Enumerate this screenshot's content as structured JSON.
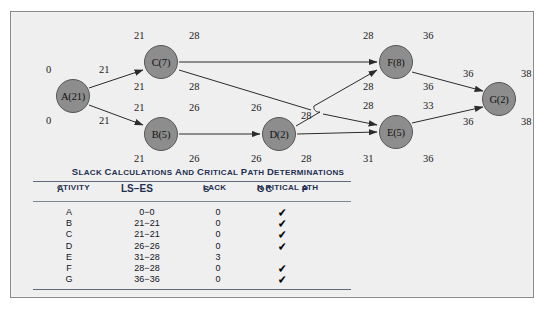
{
  "figure": {
    "background_color": "#efefef",
    "border_color": "#8a8a8a"
  },
  "diagram": {
    "type": "activity-on-node-network",
    "node_fill": "#8d8d8d",
    "node_stroke": "#575757",
    "nodes": [
      {
        "id": "A",
        "label": "A(21)",
        "duration": 21,
        "cx": 62,
        "cy": 84,
        "es": 0,
        "ef": 21,
        "ls": 0,
        "lf": 21
      },
      {
        "id": "C",
        "label": "C(7)",
        "duration": 7,
        "cx": 150,
        "cy": 50,
        "es": 21,
        "ef": 28,
        "ls": 21,
        "lf": 28
      },
      {
        "id": "B",
        "label": "B(5)",
        "duration": 5,
        "cx": 150,
        "cy": 122,
        "es": 21,
        "ef": 26,
        "ls": 21,
        "lf": 26
      },
      {
        "id": "D",
        "label": "D(2)",
        "duration": 2,
        "cx": 268,
        "cy": 122,
        "es": 26,
        "ef": 28,
        "ls": 26,
        "lf": 28
      },
      {
        "id": "F",
        "label": "F(8)",
        "duration": 8,
        "cx": 385,
        "cy": 50,
        "es": 28,
        "ef": 36,
        "ls": 28,
        "lf": 36
      },
      {
        "id": "E",
        "label": "E(5)",
        "duration": 5,
        "cx": 385,
        "cy": 120,
        "es": 28,
        "ef": 33,
        "ls": 31,
        "lf": 36
      },
      {
        "id": "G",
        "label": "G(2)",
        "duration": 2,
        "cx": 488,
        "cy": 87,
        "es": 36,
        "ef": 38,
        "ls": 36,
        "lf": 38
      }
    ],
    "edges": [
      {
        "from": "A",
        "to": "C"
      },
      {
        "from": "A",
        "to": "B"
      },
      {
        "from": "C",
        "to": "F"
      },
      {
        "from": "C",
        "to": "E"
      },
      {
        "from": "B",
        "to": "D"
      },
      {
        "from": "D",
        "to": "F"
      },
      {
        "from": "D",
        "to": "E"
      },
      {
        "from": "F",
        "to": "G"
      },
      {
        "from": "E",
        "to": "G"
      }
    ],
    "labels": [
      {
        "text": "0",
        "x": 35,
        "y": 52
      },
      {
        "text": "21",
        "x": 88,
        "y": 52
      },
      {
        "text": "0",
        "x": 35,
        "y": 103
      },
      {
        "text": "21",
        "x": 88,
        "y": 103
      },
      {
        "text": "21",
        "x": 123,
        "y": 18
      },
      {
        "text": "28",
        "x": 178,
        "y": 18
      },
      {
        "text": "21",
        "x": 123,
        "y": 69
      },
      {
        "text": "28",
        "x": 178,
        "y": 69
      },
      {
        "text": "21",
        "x": 123,
        "y": 90
      },
      {
        "text": "26",
        "x": 178,
        "y": 90
      },
      {
        "text": "21",
        "x": 123,
        "y": 141
      },
      {
        "text": "26",
        "x": 178,
        "y": 141
      },
      {
        "text": "26",
        "x": 240,
        "y": 90
      },
      {
        "text": "28",
        "x": 290,
        "y": 98
      },
      {
        "text": "26",
        "x": 240,
        "y": 141
      },
      {
        "text": "28",
        "x": 290,
        "y": 141
      },
      {
        "text": "28",
        "x": 352,
        "y": 18
      },
      {
        "text": "36",
        "x": 412,
        "y": 18
      },
      {
        "text": "28",
        "x": 352,
        "y": 69
      },
      {
        "text": "36",
        "x": 412,
        "y": 69
      },
      {
        "text": "28",
        "x": 352,
        "y": 88
      },
      {
        "text": "33",
        "x": 412,
        "y": 88
      },
      {
        "text": "31",
        "x": 352,
        "y": 141
      },
      {
        "text": "36",
        "x": 412,
        "y": 141
      },
      {
        "text": "36",
        "x": 452,
        "y": 56
      },
      {
        "text": "38",
        "x": 510,
        "y": 56
      },
      {
        "text": "36",
        "x": 452,
        "y": 104
      },
      {
        "text": "38",
        "x": 510,
        "y": 104
      }
    ]
  },
  "table": {
    "title": "Slack Calculations and Critical Path Determinations",
    "columns": [
      "Activity",
      "LS−ES",
      "Slack",
      "On Critical Path"
    ],
    "check_glyph": "✔",
    "rows": [
      {
        "activity": "A",
        "ls_es": "0−0",
        "slack": "0",
        "on_critical_path": true
      },
      {
        "activity": "B",
        "ls_es": "21−21",
        "slack": "0",
        "on_critical_path": true
      },
      {
        "activity": "C",
        "ls_es": "21−21",
        "slack": "0",
        "on_critical_path": true
      },
      {
        "activity": "D",
        "ls_es": "26−26",
        "slack": "0",
        "on_critical_path": true
      },
      {
        "activity": "E",
        "ls_es": "31−28",
        "slack": "3",
        "on_critical_path": false
      },
      {
        "activity": "F",
        "ls_es": "28−28",
        "slack": "0",
        "on_critical_path": true
      },
      {
        "activity": "G",
        "ls_es": "36−36",
        "slack": "0",
        "on_critical_path": true
      }
    ]
  }
}
